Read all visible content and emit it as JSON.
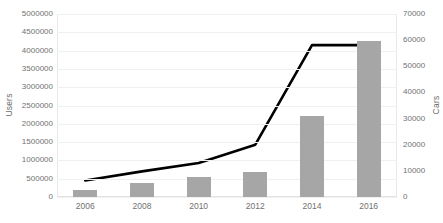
{
  "chart_data": {
    "type": "bar",
    "title": "",
    "categories": [
      "2006",
      "2008",
      "2010",
      "2012",
      "2014",
      "2016"
    ],
    "x": [
      2006,
      2008,
      2010,
      2012,
      2014,
      2016
    ],
    "xlabel": "",
    "grid": true,
    "legend": "none",
    "axes": {
      "left": {
        "label": "Users",
        "ylim": [
          0,
          5000000
        ],
        "ticks": [
          0,
          500000,
          1000000,
          1500000,
          2000000,
          2500000,
          3000000,
          3500000,
          4000000,
          4500000,
          5000000
        ],
        "tick_labels": [
          "0",
          "500000",
          "1000000",
          "1500000",
          "2000000",
          "2500000",
          "3000000",
          "3500000",
          "4000000",
          "4500000",
          "5000000"
        ]
      },
      "right": {
        "label": "Cars",
        "ylim": [
          0,
          70000
        ],
        "ticks": [
          0,
          10000,
          20000,
          30000,
          40000,
          50000,
          60000,
          70000
        ],
        "tick_labels": [
          "0",
          "10000",
          "20000",
          "30000",
          "40000",
          "50000",
          "60000",
          "70000"
        ]
      }
    },
    "series": [
      {
        "name": "Cars",
        "type": "bar",
        "axis": "right",
        "color": "#a6a6a6",
        "values": [
          2500,
          5300,
          7700,
          9500,
          31000,
          59500
        ]
      },
      {
        "name": "Users",
        "type": "line",
        "axis": "left",
        "color": "#000000",
        "values": [
          450000,
          700000,
          930000,
          1430000,
          4150000,
          4150000
        ]
      }
    ]
  },
  "colors": {
    "bar": "#a6a6a6",
    "line": "#000000",
    "grid": "#f0f0f0",
    "tick_text": "#717171",
    "background": "#ffffff"
  }
}
